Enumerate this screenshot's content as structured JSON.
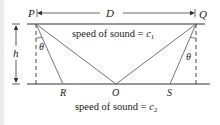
{
  "diagram": {
    "labels": {
      "P": "P",
      "Q": "Q",
      "D": "D",
      "h": "h",
      "theta_left": "θ",
      "theta_right": "θ",
      "R": "R",
      "O": "O",
      "S": "S"
    },
    "upper_medium_text": "speed of sound = ",
    "upper_medium_symbol": "c",
    "upper_medium_subscript": "1",
    "lower_medium_text": "speed of sound = ",
    "lower_medium_symbol": "c",
    "lower_medium_subscript": "2"
  }
}
